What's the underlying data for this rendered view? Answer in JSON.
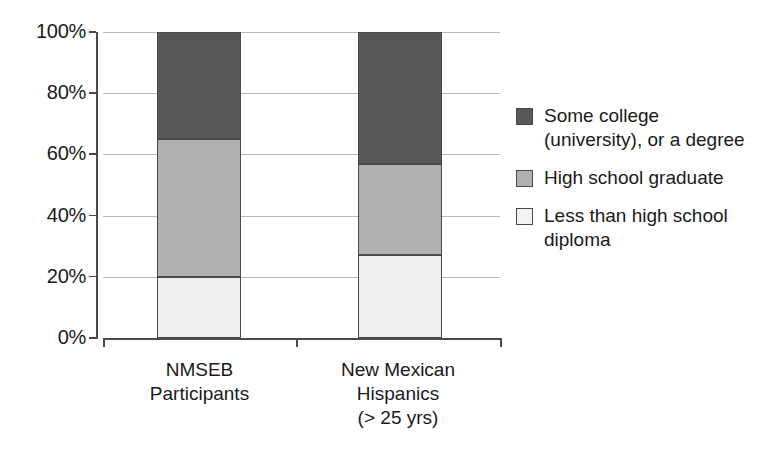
{
  "chart_data": {
    "type": "bar",
    "subtype": "stacked-100-percent",
    "title": "",
    "subtitle": "",
    "xlabel": "",
    "ylabel": "",
    "ylim": [
      0,
      100
    ],
    "yticks": [
      0,
      20,
      40,
      60,
      80,
      100
    ],
    "ytick_labels": [
      "0%",
      "20%",
      "40%",
      "60%",
      "80%",
      "100%"
    ],
    "grid": true,
    "legend_position": "right",
    "categories": [
      "NMSEB\nParticipants",
      "New Mexican\nHispanics\n(> 25 yrs)"
    ],
    "series": [
      {
        "name": "Less than high school\ndiploma",
        "color": "#eeeeee",
        "swatch_color": "#f2f2f2",
        "values": [
          20,
          27
        ]
      },
      {
        "name": "High school graduate",
        "color": "#b0b0b0",
        "swatch_color": "#b0b0b0",
        "values": [
          45,
          30
        ]
      },
      {
        "name": "Some college\n(university), or a degree",
        "color": "#585858",
        "swatch_color": "#585858",
        "values": [
          35,
          43
        ]
      }
    ],
    "stack_boundaries": [
      {
        "category": "NMSEB Participants",
        "breaks": [
          0,
          20,
          65,
          100
        ]
      },
      {
        "category": "New Mexican Hispanics (> 25 yrs)",
        "breaks": [
          0,
          27,
          57,
          100
        ]
      }
    ]
  },
  "axis": {
    "y_ticks": [
      {
        "label": "100%",
        "value": 100
      },
      {
        "label": "80%",
        "value": 80
      },
      {
        "label": "60%",
        "value": 60
      },
      {
        "label": "40%",
        "value": 40
      },
      {
        "label": "20%",
        "value": 20
      },
      {
        "label": "0%",
        "value": 0
      }
    ]
  },
  "bars": [
    {
      "label": "NMSEB\nParticipants",
      "segments": [
        {
          "name": "some-college",
          "from": 65,
          "to": 100,
          "fill": "fill-dark"
        },
        {
          "name": "hs-graduate",
          "from": 20,
          "to": 65,
          "fill": "fill-medium"
        },
        {
          "name": "less-than-hs",
          "from": 0,
          "to": 20,
          "fill": "fill-light"
        }
      ]
    },
    {
      "label": "New Mexican\nHispanics\n(> 25 yrs)",
      "segments": [
        {
          "name": "some-college",
          "from": 57,
          "to": 100,
          "fill": "fill-dark"
        },
        {
          "name": "hs-graduate",
          "from": 27,
          "to": 57,
          "fill": "fill-medium"
        },
        {
          "name": "less-than-hs",
          "from": 0,
          "to": 27,
          "fill": "fill-light"
        }
      ]
    }
  ],
  "legend": {
    "items": [
      {
        "label": "Some college\n(university), or a degree",
        "fill": "fill-dark"
      },
      {
        "label": "High school graduate",
        "fill": "fill-medium"
      },
      {
        "label": "Less than high school\ndiploma",
        "fill": "fill-light"
      }
    ]
  },
  "colors": {
    "dark": "#585858",
    "medium": "#b0b0b0",
    "light": "#eeeeee",
    "outline": "#4a4a4a",
    "gridline": "#b9b9b9",
    "text": "#1a1a1a",
    "background": "#ffffff"
  }
}
